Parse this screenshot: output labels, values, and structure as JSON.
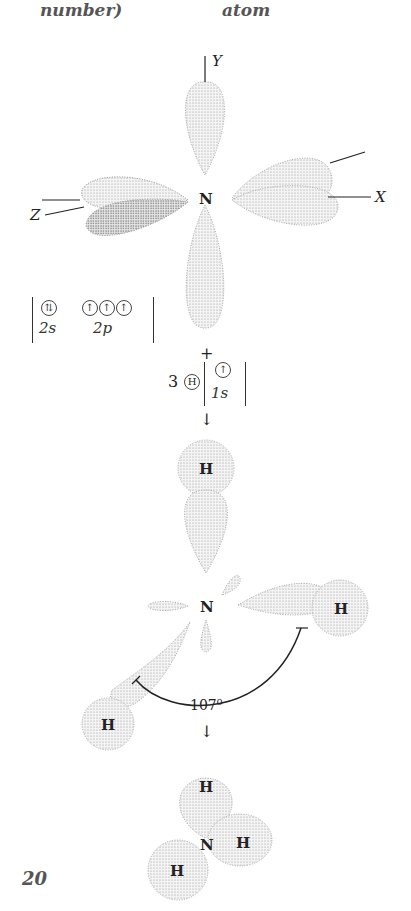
{
  "header": {
    "left_fragment": "number)",
    "right_fragment": "atom"
  },
  "nitrogen_orbitals": {
    "center_label": "N",
    "axis_labels": {
      "y": "Y",
      "x": "X",
      "z": "Z"
    },
    "configuration": {
      "2s": "⇅",
      "2p": [
        "↑",
        "↑",
        "↑"
      ],
      "label_2s": "2s",
      "label_2p": "2p"
    }
  },
  "plus": "+",
  "hydrogen": {
    "count": "3",
    "symbol": "H",
    "electron": "↑",
    "orbital": "1s"
  },
  "arrow": "↓",
  "bonding": {
    "center_label": "N",
    "h_labels": [
      "H",
      "H",
      "H"
    ],
    "bond_angle": "107⁰"
  },
  "ammonia": {
    "n_label": "N",
    "h_labels": [
      "H",
      "H",
      "H"
    ]
  },
  "page_number": "20"
}
